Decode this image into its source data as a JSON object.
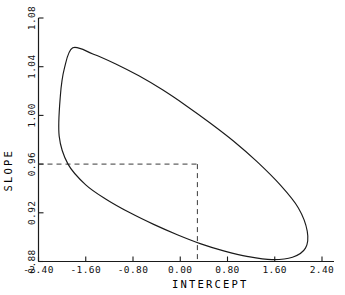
{
  "chart_data": {
    "type": "line",
    "title": "",
    "subtitle": "",
    "xlabel": "INTERCEPT",
    "ylabel": "SLOPE",
    "xlim": [
      -2.4,
      2.4
    ],
    "ylim": [
      0.88,
      1.08
    ],
    "xticks": [
      -2.4,
      -1.6,
      -0.8,
      0.0,
      0.8,
      1.6,
      2.4
    ],
    "yticks": [
      0.88,
      0.92,
      0.96,
      1.0,
      1.04,
      1.08
    ],
    "xticklabels": [
      "-2.40",
      "-1.60",
      "-0.80",
      "0.00",
      "0.80",
      "1.60",
      "2.40"
    ],
    "yticklabels": [
      "0.88",
      "0.92",
      "0.96",
      "1.00",
      "1.04",
      "1.08"
    ],
    "grid": false,
    "legend": null,
    "legend_position": "none",
    "series": [
      {
        "name": "confidence-ellipse",
        "kind": "closed-curve",
        "description": "Joint confidence region ellipse for intercept and slope, negatively correlated",
        "center": [
          0.05,
          0.9695
        ],
        "semi_major": 2.62,
        "semi_minor": 0.52,
        "rotation_deg": -21.5,
        "points": [
          [
            -1.82,
            1.0555
          ],
          [
            -1.48,
            1.0505
          ],
          [
            -1.1,
            1.0425
          ],
          [
            -0.7,
            1.0325
          ],
          [
            -0.3,
            1.021
          ],
          [
            0.1,
            1.008
          ],
          [
            0.5,
            0.994
          ],
          [
            0.9,
            0.979
          ],
          [
            1.3,
            0.962
          ],
          [
            1.7,
            0.9425
          ],
          [
            2.0,
            0.924
          ],
          [
            2.15,
            0.905
          ],
          [
            2.12,
            0.891
          ],
          [
            1.9,
            0.8835
          ],
          [
            1.55,
            0.8815
          ],
          [
            1.15,
            0.884
          ],
          [
            0.75,
            0.8885
          ],
          [
            0.35,
            0.8945
          ],
          [
            -0.05,
            0.902
          ],
          [
            -0.45,
            0.9105
          ],
          [
            -0.85,
            0.92
          ],
          [
            -1.25,
            0.931
          ],
          [
            -1.6,
            0.943
          ],
          [
            -1.9,
            0.96
          ],
          [
            -2.05,
            0.983
          ],
          [
            -2.03,
            1.016
          ],
          [
            -1.96,
            1.039
          ],
          [
            -1.82,
            1.0555
          ]
        ]
      }
    ],
    "annotations": [
      {
        "name": "reference-lines",
        "kind": "dashed-crosshair",
        "x": 0.29,
        "y": 0.96,
        "horizontal_from_x": -2.4,
        "vertical_to_y": 0.88,
        "style": "dashed"
      }
    ],
    "colors": {
      "axis": "#1a1a1a",
      "curve": "#1a1a1a",
      "dashed": "#3a3a3a",
      "background": "#ffffff",
      "text": "#000000"
    }
  }
}
